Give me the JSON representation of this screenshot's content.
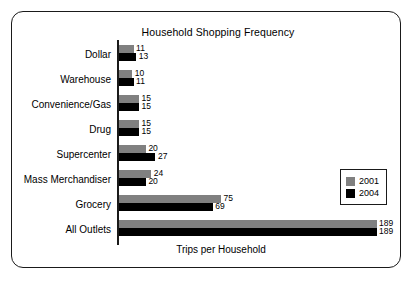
{
  "chart_data": {
    "type": "bar",
    "orientation": "horizontal",
    "title": "Household Shopping Frequency",
    "xlabel": "Trips per Household",
    "ylabel": "",
    "grid": false,
    "legend_position": "right",
    "xlim": [
      0,
      189
    ],
    "categories": [
      "Dollar",
      "Warehouse",
      "Convenience/Gas",
      "Drug",
      "Supercenter",
      "Mass Merchandiser",
      "Grocery",
      "All Outlets"
    ],
    "series": [
      {
        "name": "2001",
        "color": "#808080",
        "values": [
          11,
          10,
          15,
          15,
          20,
          24,
          75,
          189
        ]
      },
      {
        "name": "2004",
        "color": "#000000",
        "values": [
          13,
          11,
          15,
          15,
          27,
          20,
          69,
          189
        ]
      }
    ]
  },
  "legend": {
    "entries": [
      {
        "label": "2001",
        "color": "#808080"
      },
      {
        "label": "2004",
        "color": "#000000"
      }
    ]
  }
}
